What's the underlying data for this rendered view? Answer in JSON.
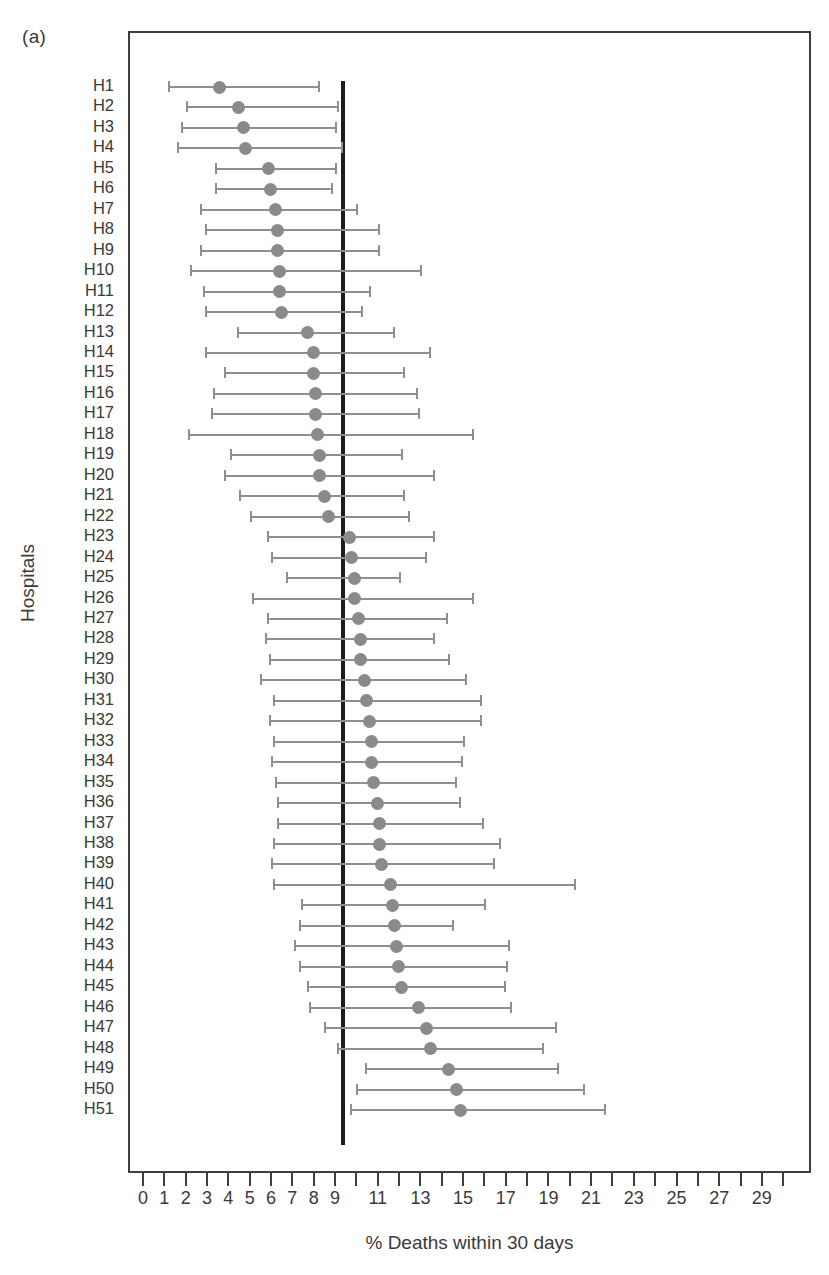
{
  "figure": {
    "panel_label": "(a)",
    "y_axis_title": "Hospitals",
    "x_axis_title": "% Deaths within 30 days"
  },
  "chart_data": {
    "type": "scatter",
    "subtype": "forest-plot",
    "title": "",
    "xlabel": "% Deaths within 30 days",
    "ylabel": "Hospitals",
    "xlim": [
      0,
      30
    ],
    "ylim_categories": 51,
    "grid": false,
    "legend": null,
    "reference_line": {
      "value": 9.3,
      "orientation": "vertical",
      "color": "#1c1c1c",
      "label": ""
    },
    "marker_color": "#8a8a8a",
    "error_bar_color": "#8f8f8f",
    "x_ticks": [
      0,
      1,
      2,
      3,
      4,
      5,
      6,
      7,
      8,
      9,
      10,
      11,
      12,
      13,
      14,
      15,
      16,
      17,
      18,
      19,
      20,
      21,
      22,
      23,
      24,
      25,
      26,
      27,
      28,
      29,
      30
    ],
    "x_tick_labels": [
      {
        "value": 0,
        "label": "0"
      },
      {
        "value": 1,
        "label": "1"
      },
      {
        "value": 2,
        "label": "2"
      },
      {
        "value": 3,
        "label": "3"
      },
      {
        "value": 4,
        "label": "4"
      },
      {
        "value": 5,
        "label": "5"
      },
      {
        "value": 6,
        "label": "6"
      },
      {
        "value": 7,
        "label": "7"
      },
      {
        "value": 8,
        "label": "8"
      },
      {
        "value": 9,
        "label": "9"
      },
      {
        "value": 11,
        "label": "11"
      },
      {
        "value": 13,
        "label": "13"
      },
      {
        "value": 15,
        "label": "15"
      },
      {
        "value": 17,
        "label": "17"
      },
      {
        "value": 19,
        "label": "19"
      },
      {
        "value": 21,
        "label": "21"
      },
      {
        "value": 23,
        "label": "23"
      },
      {
        "value": 25,
        "label": "25"
      },
      {
        "value": 27,
        "label": "27"
      },
      {
        "value": 29,
        "label": "29"
      }
    ],
    "categories": [
      "H1",
      "H2",
      "H3",
      "H4",
      "H5",
      "H6",
      "H7",
      "H8",
      "H9",
      "H10",
      "H11",
      "H12",
      "H13",
      "H14",
      "H15",
      "H16",
      "H17",
      "H18",
      "H19",
      "H20",
      "H21",
      "H22",
      "H23",
      "H24",
      "H25",
      "H26",
      "H27",
      "H28",
      "H29",
      "H30",
      "H31",
      "H32",
      "H33",
      "H34",
      "H35",
      "H36",
      "H37",
      "H38",
      "H39",
      "H40",
      "H41",
      "H42",
      "H43",
      "H44",
      "H45",
      "H46",
      "H47",
      "H48",
      "H49",
      "H50",
      "H51"
    ],
    "estimates": [
      3.5,
      4.4,
      4.6,
      4.7,
      5.8,
      5.9,
      6.1,
      6.2,
      6.2,
      6.3,
      6.3,
      6.4,
      7.6,
      7.9,
      7.9,
      8.0,
      8.0,
      8.1,
      8.2,
      8.2,
      8.4,
      8.6,
      9.6,
      9.7,
      9.8,
      9.8,
      10.0,
      10.1,
      10.1,
      10.3,
      10.4,
      10.5,
      10.6,
      10.6,
      10.7,
      10.9,
      11.0,
      11.0,
      11.1,
      11.5,
      11.6,
      11.7,
      11.8,
      11.9,
      12.0,
      12.8,
      13.2,
      13.4,
      14.2,
      14.6,
      14.8
    ],
    "ci_lower": [
      1.1,
      1.9,
      1.7,
      1.5,
      3.3,
      3.3,
      2.6,
      2.8,
      2.6,
      2.1,
      2.7,
      2.8,
      4.3,
      2.8,
      3.7,
      3.2,
      3.1,
      2.0,
      4.0,
      3.7,
      4.4,
      4.9,
      5.7,
      5.9,
      6.6,
      5.0,
      5.7,
      5.6,
      5.8,
      5.4,
      6.0,
      5.8,
      6.0,
      5.9,
      6.1,
      6.2,
      6.2,
      6.0,
      5.9,
      6.0,
      7.3,
      7.2,
      7.0,
      7.2,
      7.6,
      7.7,
      8.4,
      9.0,
      10.3,
      9.9,
      9.6
    ],
    "ci_upper": [
      8.2,
      9.1,
      9.0,
      9.3,
      9.0,
      8.8,
      10.0,
      11.0,
      11.0,
      13.0,
      10.6,
      10.2,
      11.7,
      13.4,
      12.2,
      12.8,
      12.9,
      15.4,
      12.1,
      13.6,
      12.2,
      12.4,
      13.6,
      13.2,
      12.0,
      15.4,
      14.2,
      13.6,
      14.3,
      15.1,
      15.8,
      15.8,
      15.0,
      14.9,
      14.6,
      14.8,
      15.9,
      16.7,
      16.4,
      20.2,
      16.0,
      14.5,
      17.1,
      17.0,
      16.9,
      17.2,
      19.3,
      18.7,
      19.4,
      20.6,
      21.6
    ]
  }
}
